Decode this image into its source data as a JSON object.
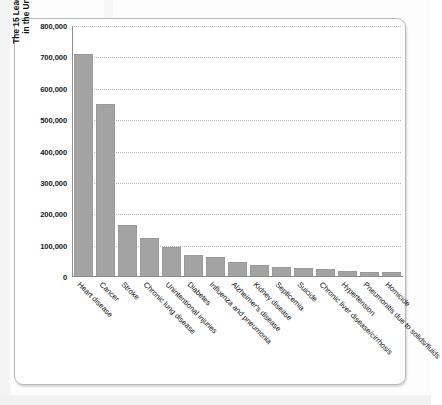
{
  "chart_data": {
    "type": "bar",
    "title": "",
    "xlabel": "",
    "ylabel": "The 15 Leading Causes of Death in the United States in 2000",
    "ylabel_lines": [
      "The 15 Leading Causes of Death",
      "in the United States in 2000"
    ],
    "ylim": [
      0,
      800000
    ],
    "grid": true,
    "legend": "none",
    "ytick_labels": [
      "800,000",
      "700,000",
      "600,000",
      "500,000",
      "400,000",
      "300,000",
      "200,000",
      "100,000",
      "0"
    ],
    "ytick_values": [
      800000,
      700000,
      600000,
      500000,
      400000,
      300000,
      200000,
      100000,
      0
    ],
    "categories": [
      "Heart disease",
      "Cancer",
      "Stroke",
      "Chronic lung disease",
      "Unintentional injuries",
      "Diabetes",
      "Influenza and pneumonia",
      "Alzheimer's disease",
      "Kidney disease",
      "Septicemia",
      "Suicide",
      "Chronic liver disease/cirrhosis",
      "Hypertension",
      "Pneumonitis due to solids/fluids",
      "Homicide"
    ],
    "values": [
      710000,
      553000,
      167000,
      124000,
      97000,
      69000,
      65000,
      49000,
      37000,
      31000,
      29000,
      26000,
      18000,
      17000,
      16000
    ],
    "bar_color": "#a3a3a3",
    "axis_color": "#8d8d8d",
    "gridline_color": "#b4b4b4"
  }
}
